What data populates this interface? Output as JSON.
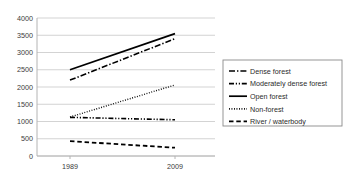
{
  "chart_data": {
    "type": "line",
    "title": "",
    "subtitle": "",
    "xlabel": "",
    "ylabel": "",
    "x": [
      "1989",
      "2009"
    ],
    "categories": [
      "1989",
      "2009"
    ],
    "xtick_labels": [
      "1989",
      "2009"
    ],
    "ytick_labels": [
      "0",
      "500",
      "1000",
      "1500",
      "2000",
      "2500",
      "3000",
      "3500",
      "4000"
    ],
    "ytick_values": [
      0,
      500,
      1000,
      1500,
      2000,
      2500,
      3000,
      3500,
      4000
    ],
    "ylim": [
      0,
      4000
    ],
    "grid": "horizontal",
    "legend_position": "right",
    "series": [
      {
        "name": "Dense forest",
        "values": [
          2200,
          3400
        ],
        "style": "dash-dot",
        "color": "#000000",
        "width": 1.6
      },
      {
        "name": "Moderately dense forest",
        "values": [
          1120,
          1050
        ],
        "style": "dash-dot-dot",
        "color": "#000000",
        "width": 1.6
      },
      {
        "name": "Open forest",
        "values": [
          2500,
          3550
        ],
        "style": "solid",
        "color": "#000000",
        "width": 1.8
      },
      {
        "name": "Non-forest",
        "values": [
          1130,
          2060
        ],
        "style": "dotted",
        "color": "#000000",
        "width": 1.4
      },
      {
        "name": "River / waterbody",
        "values": [
          430,
          240
        ],
        "style": "dashed",
        "color": "#000000",
        "width": 1.8
      }
    ]
  },
  "legend": {
    "items": [
      {
        "label": "Dense forest",
        "style": "dash-dot"
      },
      {
        "label": "Moderately dense forest",
        "style": "dash-dot-dot"
      },
      {
        "label": "Open forest",
        "style": "solid"
      },
      {
        "label": "Non-forest",
        "style": "dotted"
      },
      {
        "label": "River / waterbody",
        "style": "dashed"
      }
    ]
  },
  "colors": {
    "background": "#ffffff",
    "grid": "#c8c8c8",
    "axis": "#b4b4b4",
    "text": "#3a3a3a",
    "series": "#000000",
    "legend_border": "#8a8a8a"
  }
}
